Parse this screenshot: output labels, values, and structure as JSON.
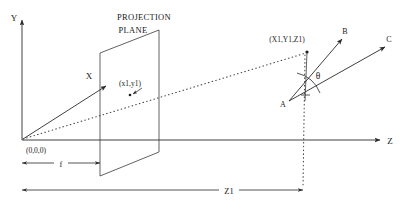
{
  "diagram": {
    "title_lines": [
      "PROJECTION",
      "PLANE"
    ],
    "axes": {
      "y_label": "Y",
      "z_label": "Z",
      "x_label": "X"
    },
    "points": {
      "origin_label": "(0,0,0)",
      "image_point_label": "(x1,y1)",
      "world_point_label": "(X1,Y1,Z1)",
      "vertex_label": "A",
      "ray_b_label": "B",
      "ray_c_label": "C"
    },
    "angle": {
      "theta_label": "θ"
    },
    "dimensions": {
      "focal_label": "f",
      "depth_label": "Z1"
    },
    "colors": {
      "line": "#2a2a2a",
      "dotted": "#4a4a4a",
      "text": "#1a1a1a",
      "background": "#ffffff"
    }
  }
}
